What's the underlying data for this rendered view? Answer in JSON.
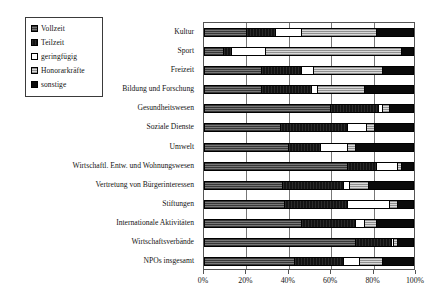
{
  "chart_data": {
    "type": "bar",
    "orientation": "horizontal",
    "stacked": true,
    "normalized": true,
    "title": "",
    "xlabel": "",
    "ylabel": "",
    "xlim": [
      0,
      100
    ],
    "xticks": [
      0,
      20,
      40,
      60,
      80,
      100
    ],
    "xticklabels": [
      "0%",
      "20%",
      "40%",
      "60%",
      "80%",
      "100%"
    ],
    "grid": true,
    "grid_axis": "x",
    "legend_position": "upper-left-outside",
    "categories": [
      "Kultur",
      "Sport",
      "Freizeit",
      "Bildung und Forschung",
      "Gesundheitswesen",
      "Soziale Dienste",
      "Umwelt",
      "Wirtschaftl. Entw. und Wohnungswesen",
      "Vertretung von Bürgerinteressen",
      "Stiftungen",
      "Internationale Aktivitäten",
      "Wirtschaftsverbände",
      "NPOs insgesamt"
    ],
    "series": [
      {
        "name": "Vollzeit",
        "fill": "f-vollzeit",
        "color": "#5a5a5a",
        "values": [
          20,
          9,
          27,
          27,
          60,
          36,
          40,
          68,
          37,
          38,
          46,
          72,
          43
        ]
      },
      {
        "name": "Teilzeit",
        "fill": "f-teilzeit",
        "color": "#131313",
        "values": [
          14,
          4,
          19,
          24,
          23,
          32,
          15,
          14,
          29,
          30,
          26,
          17,
          23
        ]
      },
      {
        "name": "geringfügig",
        "fill": "f-gering",
        "color": "#ffffff",
        "values": [
          12,
          16,
          6,
          3,
          2,
          9,
          13,
          10,
          3,
          20,
          4,
          1,
          8
        ]
      },
      {
        "name": "Honorarkräfte",
        "fill": "f-honorar",
        "color": "#b9b9b9",
        "values": [
          36,
          65,
          33,
          22,
          3,
          4,
          4,
          2,
          9,
          4,
          6,
          2,
          11
        ]
      },
      {
        "name": "sonstige",
        "fill": "f-sonstige",
        "color": "#0a0a0a",
        "values": [
          18,
          6,
          15,
          24,
          12,
          19,
          28,
          6,
          22,
          8,
          18,
          8,
          15
        ]
      }
    ]
  },
  "legend": {
    "items": [
      {
        "label": "Vollzeit",
        "fill": "f-vollzeit",
        "swatch_name": "legend-swatch-vollzeit"
      },
      {
        "label": "Teilzeit",
        "fill": "f-teilzeit",
        "swatch_name": "legend-swatch-teilzeit"
      },
      {
        "label": "geringfügig",
        "fill": "f-gering",
        "swatch_name": "legend-swatch-geringfuegig"
      },
      {
        "label": "Honorarkräfte",
        "fill": "f-honorar",
        "swatch_name": "legend-swatch-honorarkraefte"
      },
      {
        "label": "sonstige",
        "fill": "f-sonstige",
        "swatch_name": "legend-swatch-sonstige"
      }
    ]
  }
}
